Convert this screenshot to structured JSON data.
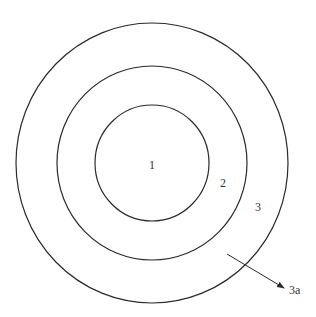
{
  "diagram": {
    "type": "concentric-circles",
    "colors": {
      "stroke": "#2a2a2a",
      "text": "#333333",
      "background": "#ffffff"
    },
    "circles": [
      {
        "id": "outer",
        "cx": 152,
        "cy": 163,
        "rx": 136,
        "ry": 140
      },
      {
        "id": "middle",
        "cx": 152,
        "cy": 163,
        "rx": 95,
        "ry": 97
      },
      {
        "id": "inner",
        "cx": 152,
        "cy": 163,
        "rx": 57,
        "ry": 58
      }
    ],
    "labels": {
      "inner": "1",
      "middle_ring": "2",
      "outer_ring": "3",
      "arrow_target": "3a"
    },
    "arrow": {
      "x1": 227,
      "y1": 254,
      "x2": 284,
      "y2": 288
    }
  }
}
